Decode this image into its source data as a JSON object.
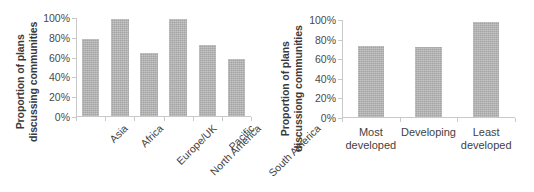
{
  "figure": {
    "background": "#ffffff",
    "bar_color": "#b0b0b0",
    "axis_color": "#c9c9c9",
    "text_color": "#3f3f3f"
  },
  "chart_data": [
    {
      "type": "bar",
      "panel": "left",
      "title": "",
      "xlabel": "",
      "ylabel": "Proportion of plans discussing communities",
      "ylabel_line1": "Proportion of plans",
      "ylabel_line2": "discussing communities",
      "categories": [
        "Asia",
        "Africa",
        "Europe/UK",
        "North America",
        "Pacific",
        "South America"
      ],
      "values": [
        79,
        99,
        65,
        99,
        73,
        59
      ],
      "ylim": [
        0,
        100
      ],
      "yticks": [
        0,
        20,
        40,
        60,
        80,
        100
      ],
      "ytick_labels": [
        "0%",
        "20%",
        "40%",
        "60%",
        "80%",
        "100%"
      ],
      "grid": false,
      "legend": false,
      "xtick_rotation": -45
    },
    {
      "type": "bar",
      "panel": "right",
      "title": "",
      "xlabel": "",
      "ylabel": "Proportion of plans discussiong communities",
      "ylabel_line1": "Proportion of plans",
      "ylabel_line2": "discussiong communities",
      "categories": [
        "Most developed",
        "Developing",
        "Least developed"
      ],
      "values": [
        73,
        72,
        98
      ],
      "ylim": [
        0,
        100
      ],
      "yticks": [
        0,
        20,
        40,
        60,
        80,
        100
      ],
      "ytick_labels": [
        "0%",
        "20%",
        "40%",
        "60%",
        "80%",
        "100%"
      ],
      "grid": false,
      "legend": false,
      "xtick_rotation": 0
    }
  ]
}
